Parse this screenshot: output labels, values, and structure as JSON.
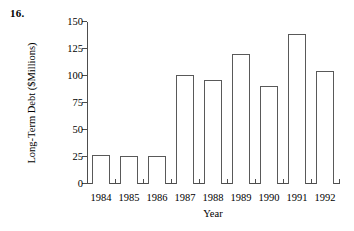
{
  "figure": {
    "problem_number": "16."
  },
  "chart_data": {
    "type": "bar",
    "title": "",
    "xlabel": "Year",
    "ylabel": "Long-Term Debt ($Millions)",
    "categories": [
      "1984",
      "1985",
      "1986",
      "1987",
      "1988",
      "1989",
      "1990",
      "1991",
      "1992"
    ],
    "values": [
      27,
      26,
      26,
      101,
      96,
      120,
      91,
      139,
      105
    ],
    "ylim": [
      0,
      150
    ],
    "yticks": [
      0,
      25,
      50,
      75,
      100,
      125,
      150
    ],
    "ytick_labels": [
      "0",
      "25",
      "50",
      "75",
      "100",
      "125",
      "150"
    ],
    "grid": false,
    "legend": null,
    "bar_color": "#ffffff",
    "bar_edge_color": "#595959",
    "axis_color": "#4d4d4d"
  }
}
